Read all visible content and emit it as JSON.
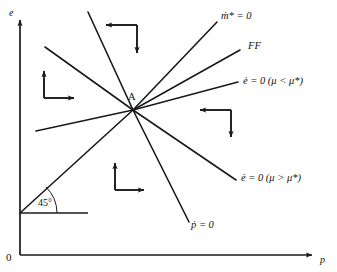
{
  "figure": {
    "type": "phase-diagram",
    "background": "#ffffff",
    "stroke_color": "#1a1a1a",
    "axes": {
      "y_label": "e",
      "x_label": "p",
      "origin_label": "0"
    },
    "equilibrium": {
      "point_label": "A",
      "x": 133,
      "y": 110
    },
    "angle": {
      "label": "45°",
      "value_deg": 45
    },
    "curves": [
      {
        "name": "mdot-star-zero",
        "label": "ṁ* = 0",
        "label_x": 221,
        "label_y": 17
      },
      {
        "name": "ff-schedule",
        "label": "FF",
        "label_x": 248,
        "label_y": 47
      },
      {
        "name": "edot-zero-mu-less",
        "label": "ė = 0 (μ < μ*)",
        "label_x": 243,
        "label_y": 82
      },
      {
        "name": "edot-zero-mu-greater",
        "label": "ė = 0 (μ > μ*)",
        "label_x": 241,
        "label_y": 179
      },
      {
        "name": "pdot-zero",
        "label": "ṗ = 0",
        "label_x": 191,
        "label_y": 226
      },
      {
        "name": "forty-five-degree-line",
        "label": "",
        "label_x": 0,
        "label_y": 0
      },
      {
        "name": "northwest-ray",
        "label": "",
        "label_x": 0,
        "label_y": 0
      },
      {
        "name": "west-ray",
        "label": "",
        "label_x": 0,
        "label_y": 0
      }
    ],
    "motion_arrows": [
      {
        "name": "arrow-pair-north",
        "horizontal": "left",
        "vertical": "down"
      },
      {
        "name": "arrow-pair-west",
        "horizontal": "right",
        "vertical": "up"
      },
      {
        "name": "arrow-pair-east",
        "horizontal": "left",
        "vertical": "down"
      },
      {
        "name": "arrow-pair-south",
        "horizontal": "right",
        "vertical": "up"
      }
    ]
  }
}
